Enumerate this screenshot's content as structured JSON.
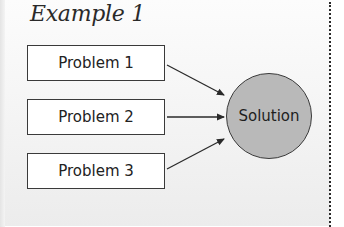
{
  "diagram": {
    "title": "Example 1",
    "problems": [
      {
        "label": "Problem 1"
      },
      {
        "label": "Problem 2"
      },
      {
        "label": "Problem 3"
      }
    ],
    "solution": {
      "label": "Solution"
    },
    "edges": [
      {
        "from": "Problem 1",
        "to": "Solution"
      },
      {
        "from": "Problem 2",
        "to": "Solution"
      },
      {
        "from": "Problem 3",
        "to": "Solution"
      }
    ],
    "colors": {
      "solution_fill": "#b9b9b9",
      "box_fill": "#ffffff",
      "stroke": "#3a3a3a"
    }
  }
}
